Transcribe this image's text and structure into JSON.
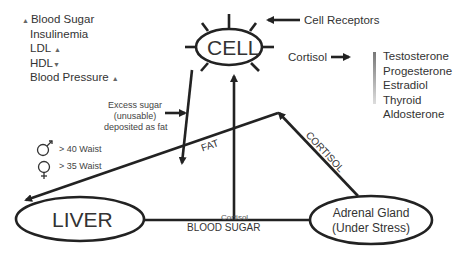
{
  "nodes": {
    "cell": "CELL",
    "liver": "LIVER",
    "adrenal_line1": "Adrenal Gland",
    "adrenal_line2": "(Under Stress)"
  },
  "labels": {
    "cell_receptors": "Cell Receptors",
    "cortisol": "Cortisol",
    "fat": "FAT",
    "cortisol_edge": "CORTISOL",
    "blood_sugar": "BLOOD SUGAR",
    "cortisol_overlap": "Cortisol",
    "excess_sugar": [
      "Excess sugar",
      "(unusable)",
      "deposited as fat"
    ]
  },
  "left_list": [
    {
      "text": "Blood Sugar",
      "prefix": "▲",
      "suffix": ""
    },
    {
      "text": "Insulinemia",
      "prefix": "",
      "suffix": ""
    },
    {
      "text": "LDL",
      "prefix": "",
      "suffix": "▲"
    },
    {
      "text": "HDL",
      "prefix": "",
      "suffix": "▼"
    },
    {
      "text": "Blood Pressure",
      "prefix": "",
      "suffix": "▲"
    }
  ],
  "hormones": [
    "Testosterone",
    "Progesterone",
    "Estradiol",
    "Thyroid",
    "Aldosterone"
  ],
  "waist": [
    {
      "symbol": "male-symbol",
      "text": "> 40 Waist"
    },
    {
      "symbol": "female-symbol",
      "text": "> 35 Waist"
    }
  ]
}
